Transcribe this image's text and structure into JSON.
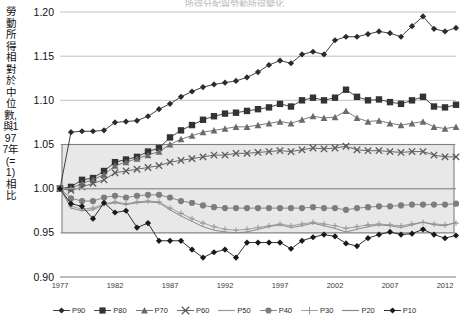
{
  "title_clipped": "所得分配與勞動所得變化",
  "axis": {
    "ylabel": "勞動所得相對於中位數,與1977年(=1)相比",
    "yticks": [
      "1.20",
      "1.15",
      "1.10",
      "1.05",
      "1.00",
      "0.95",
      "0.90"
    ],
    "xticks": [
      "1977",
      "1982",
      "1987",
      "1992",
      "1997",
      "2002",
      "2007",
      "2012"
    ]
  },
  "legend": {
    "items": [
      {
        "label": "P90",
        "marker": "diamond-marker",
        "color": "#2b2b2b"
      },
      {
        "label": "P80",
        "marker": "square-marker",
        "color": "#333333"
      },
      {
        "label": "P70",
        "marker": "triangle-marker",
        "color": "#6b6b6b"
      },
      {
        "label": "P60",
        "marker": "cross-x-marker",
        "color": "#5a5a5a"
      },
      {
        "label": "P50",
        "marker": "line-marker",
        "color": "#9a9a9a"
      },
      {
        "label": "P40",
        "marker": "circle-marker",
        "color": "#7d7d7d"
      },
      {
        "label": "P30",
        "marker": "plus-marker",
        "color": "#9a9a9a"
      },
      {
        "label": "P20",
        "marker": "line-marker",
        "color": "#8a8a8a"
      },
      {
        "label": "P10",
        "marker": "diamond-marker",
        "color": "#1a1a1a"
      }
    ]
  },
  "band": {
    "from": 0.95,
    "to": 1.05,
    "fill": "#e8e8e8",
    "stroke": "#808080"
  },
  "chart_data": {
    "type": "line",
    "title": "所得分配與勞動所得變化",
    "xlabel": "",
    "ylabel": "勞動所得相對於中位數,與1977年(=1)相比",
    "xlim": [
      1977,
      2013
    ],
    "ylim": [
      0.9,
      1.2
    ],
    "grid": true,
    "legend_position": "bottom",
    "x": [
      1977,
      1978,
      1979,
      1980,
      1981,
      1982,
      1983,
      1984,
      1985,
      1986,
      1987,
      1988,
      1989,
      1990,
      1991,
      1992,
      1993,
      1994,
      1995,
      1996,
      1997,
      1998,
      1999,
      2000,
      2001,
      2002,
      2003,
      2004,
      2005,
      2006,
      2007,
      2008,
      2009,
      2010,
      2011,
      2012,
      2013
    ],
    "series": [
      {
        "name": "P90",
        "marker": "diamond-marker",
        "color": "#2b2b2b",
        "values": [
          1.0,
          1.064,
          1.065,
          1.065,
          1.066,
          1.075,
          1.076,
          1.077,
          1.082,
          1.09,
          1.096,
          1.104,
          1.11,
          1.115,
          1.118,
          1.12,
          1.122,
          1.126,
          1.132,
          1.14,
          1.145,
          1.142,
          1.152,
          1.155,
          1.152,
          1.168,
          1.172,
          1.172,
          1.175,
          1.178,
          1.176,
          1.172,
          1.184,
          1.195,
          1.181,
          1.178,
          1.182
        ]
      },
      {
        "name": "P80",
        "marker": "square-marker",
        "color": "#333333",
        "values": [
          1.0,
          1.002,
          1.01,
          1.012,
          1.02,
          1.03,
          1.033,
          1.036,
          1.042,
          1.046,
          1.058,
          1.066,
          1.072,
          1.078,
          1.082,
          1.085,
          1.086,
          1.088,
          1.09,
          1.092,
          1.096,
          1.093,
          1.1,
          1.103,
          1.1,
          1.103,
          1.112,
          1.104,
          1.1,
          1.101,
          1.098,
          1.096,
          1.1,
          1.104,
          1.093,
          1.092,
          1.095
        ]
      },
      {
        "name": "P70",
        "marker": "triangle-marker",
        "color": "#6b6b6b",
        "values": [
          1.0,
          1.0,
          1.006,
          1.01,
          1.016,
          1.026,
          1.03,
          1.034,
          1.038,
          1.042,
          1.05,
          1.056,
          1.06,
          1.064,
          1.066,
          1.068,
          1.07,
          1.07,
          1.072,
          1.074,
          1.076,
          1.074,
          1.078,
          1.082,
          1.08,
          1.081,
          1.088,
          1.08,
          1.076,
          1.077,
          1.074,
          1.072,
          1.074,
          1.076,
          1.07,
          1.068,
          1.07
        ]
      },
      {
        "name": "P60",
        "marker": "cross-x-marker",
        "color": "#5a5a5a",
        "values": [
          1.0,
          0.998,
          1.002,
          1.006,
          1.01,
          1.018,
          1.02,
          1.022,
          1.024,
          1.026,
          1.03,
          1.032,
          1.034,
          1.036,
          1.038,
          1.038,
          1.04,
          1.04,
          1.041,
          1.042,
          1.043,
          1.042,
          1.044,
          1.046,
          1.045,
          1.046,
          1.048,
          1.044,
          1.043,
          1.043,
          1.042,
          1.041,
          1.042,
          1.042,
          1.038,
          1.036,
          1.036
        ]
      },
      {
        "name": "P50",
        "marker": "line-marker",
        "color": "#9a9a9a",
        "values": [
          1.0,
          1.0,
          1.0,
          1.0,
          1.0,
          1.0,
          1.0,
          1.0,
          1.0,
          1.0,
          1.0,
          1.0,
          1.0,
          1.0,
          1.0,
          1.0,
          1.0,
          1.0,
          1.0,
          1.0,
          1.0,
          1.0,
          1.0,
          1.0,
          1.0,
          1.0,
          1.0,
          1.0,
          1.0,
          1.0,
          1.0,
          1.0,
          1.0,
          1.0,
          1.0,
          1.0,
          1.0
        ]
      },
      {
        "name": "P40",
        "marker": "circle-marker",
        "color": "#7d7d7d",
        "values": [
          1.0,
          0.989,
          0.986,
          0.986,
          0.99,
          0.992,
          0.99,
          0.992,
          0.993,
          0.993,
          0.99,
          0.986,
          0.984,
          0.981,
          0.979,
          0.978,
          0.978,
          0.978,
          0.978,
          0.978,
          0.978,
          0.978,
          0.978,
          0.979,
          0.978,
          0.978,
          0.976,
          0.978,
          0.979,
          0.98,
          0.98,
          0.981,
          0.982,
          0.982,
          0.982,
          0.982,
          0.983
        ]
      },
      {
        "name": "P30",
        "marker": "plus-marker",
        "color": "#9a9a9a",
        "values": [
          1.0,
          0.98,
          0.977,
          0.978,
          0.983,
          0.985,
          0.983,
          0.985,
          0.986,
          0.985,
          0.978,
          0.972,
          0.966,
          0.961,
          0.957,
          0.954,
          0.953,
          0.954,
          0.956,
          0.958,
          0.96,
          0.958,
          0.96,
          0.962,
          0.96,
          0.958,
          0.955,
          0.957,
          0.959,
          0.96,
          0.959,
          0.958,
          0.96,
          0.962,
          0.96,
          0.959,
          0.961
        ]
      },
      {
        "name": "P20",
        "marker": "line-marker",
        "color": "#8a8a8a",
        "values": [
          1.0,
          0.978,
          0.975,
          0.976,
          0.982,
          0.984,
          0.982,
          0.984,
          0.985,
          0.984,
          0.976,
          0.969,
          0.963,
          0.957,
          0.953,
          0.951,
          0.95,
          0.951,
          0.954,
          0.957,
          0.959,
          0.956,
          0.958,
          0.961,
          0.958,
          0.955,
          0.951,
          0.954,
          0.957,
          0.959,
          0.958,
          0.956,
          0.959,
          0.962,
          0.959,
          0.958,
          0.962
        ]
      },
      {
        "name": "P10",
        "marker": "diamond-marker",
        "color": "#1a1a1a",
        "values": [
          1.0,
          0.983,
          0.98,
          0.966,
          0.984,
          0.973,
          0.975,
          0.956,
          0.961,
          0.941,
          0.941,
          0.941,
          0.931,
          0.922,
          0.928,
          0.931,
          0.922,
          0.939,
          0.939,
          0.939,
          0.939,
          0.932,
          0.941,
          0.945,
          0.948,
          0.946,
          0.938,
          0.935,
          0.944,
          0.948,
          0.951,
          0.948,
          0.949,
          0.954,
          0.948,
          0.944,
          0.947
        ]
      }
    ]
  }
}
